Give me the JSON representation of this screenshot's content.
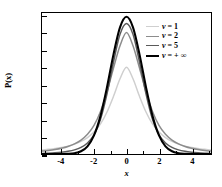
{
  "chart_data": {
    "type": "line",
    "title": "",
    "xlabel": "x",
    "ylabel": "P(x)",
    "xlim": [
      -5.2,
      5.2
    ],
    "ylim": [
      0.0,
      0.41
    ],
    "grid": false,
    "legend_position": "top-right",
    "xticks": [
      "-4",
      "-2",
      "0",
      "2",
      "4"
    ],
    "xtick_values": [
      -4,
      -2,
      0,
      2,
      4
    ],
    "xminor_values": [
      -5,
      -3,
      -1,
      1,
      3,
      5
    ],
    "yticks": [
      "0.00",
      "0.05",
      "0.10",
      "0.15",
      "0.20",
      "0.25",
      "0.30",
      "0.35",
      "0.40"
    ],
    "ytick_values": [
      0.0,
      0.05,
      0.1,
      0.15,
      0.2,
      0.25,
      0.3,
      0.35,
      0.4
    ],
    "series": [
      {
        "name": "v = 1",
        "nu": 1,
        "color": "#cfcfcf",
        "width": 1.5,
        "peak": 0.3183,
        "x": [
          -5.2,
          -4.8,
          -4.4,
          -4,
          -3.6,
          -3.2,
          -2.8,
          -2.4,
          -2,
          -1.6,
          -1.2,
          -0.8,
          -0.4,
          0,
          0.4,
          0.8,
          1.2,
          1.6,
          2,
          2.4,
          2.8,
          3.2,
          3.6,
          4,
          4.4,
          4.8,
          5.2
        ],
        "y": [
          0.0115,
          0.0135,
          0.016,
          0.0187,
          0.023,
          0.0288,
          0.0366,
          0.0478,
          0.0637,
          0.0874,
          0.1222,
          0.1677,
          0.2188,
          0.2523,
          0.2188,
          0.1677,
          0.1222,
          0.0874,
          0.0637,
          0.0478,
          0.0366,
          0.0288,
          0.023,
          0.0187,
          0.016,
          0.0135,
          0.0115
        ]
      },
      {
        "name": "v = 2",
        "nu": 2,
        "color": "#8c8c8c",
        "width": 1.5,
        "peak": 0.3536,
        "x": [
          -5.2,
          -4.8,
          -4.4,
          -4,
          -3.6,
          -3.2,
          -2.8,
          -2.4,
          -2,
          -1.6,
          -1.2,
          -0.8,
          -0.4,
          0,
          0.4,
          0.8,
          1.2,
          1.6,
          2,
          2.4,
          2.8,
          3.2,
          3.6,
          4,
          4.4,
          4.8,
          5.2
        ],
        "y": [
          0.0084,
          0.0103,
          0.0129,
          0.0166,
          0.0218,
          0.0293,
          0.0404,
          0.0573,
          0.0833,
          0.1238,
          0.1808,
          0.25,
          0.3147,
          0.3536,
          0.3147,
          0.25,
          0.1808,
          0.1238,
          0.0833,
          0.0573,
          0.0404,
          0.0293,
          0.0218,
          0.0166,
          0.0129,
          0.0103,
          0.0084
        ]
      },
      {
        "name": "v = 5",
        "nu": 5,
        "color": "#5a5a5a",
        "width": 1.5,
        "peak": 0.3796,
        "x": [
          -5.2,
          -4.8,
          -4.4,
          -4,
          -3.6,
          -3.2,
          -2.8,
          -2.4,
          -2,
          -1.6,
          -1.2,
          -0.8,
          -0.4,
          0,
          0.4,
          0.8,
          1.2,
          1.6,
          2,
          2.4,
          2.8,
          3.2,
          3.6,
          4,
          4.4,
          4.8,
          5.2
        ],
        "y": [
          0.0018,
          0.0025,
          0.0035,
          0.0051,
          0.0077,
          0.012,
          0.0193,
          0.0322,
          0.056,
          0.1007,
          0.1749,
          0.2676,
          0.3478,
          0.3796,
          0.3478,
          0.2676,
          0.1749,
          0.1007,
          0.056,
          0.0322,
          0.0193,
          0.012,
          0.0077,
          0.0051,
          0.0035,
          0.0025,
          0.0018
        ]
      },
      {
        "name": "v = + ∞",
        "nu": "+inf",
        "color": "#000000",
        "width": 2.1,
        "peak": 0.3989,
        "x": [
          -5.2,
          -4.8,
          -4.4,
          -4,
          -3.6,
          -3.2,
          -2.8,
          -2.4,
          -2,
          -1.6,
          -1.2,
          -0.8,
          -0.4,
          0,
          0.4,
          0.8,
          1.2,
          1.6,
          2,
          2.4,
          2.8,
          3.2,
          3.6,
          4,
          4.4,
          4.8,
          5.2
        ],
        "y": [
          0.0,
          0.0,
          0.0,
          0.0001,
          0.0006,
          0.0024,
          0.0079,
          0.0224,
          0.054,
          0.1109,
          0.1942,
          0.2897,
          0.3683,
          0.3989,
          0.3683,
          0.2897,
          0.1942,
          0.1109,
          0.054,
          0.0224,
          0.0079,
          0.0024,
          0.0006,
          0.0001,
          0.0,
          0.0,
          0.0
        ]
      }
    ]
  },
  "legend": {
    "items": [
      {
        "label": "v = 1",
        "color": "#cfcfcf"
      },
      {
        "label": "v = 2",
        "color": "#8c8c8c"
      },
      {
        "label": "v = 5",
        "color": "#5a5a5a"
      },
      {
        "label": "v = + ∞",
        "color": "#000000"
      }
    ]
  },
  "axes": {
    "frame_color": "#000000",
    "background": "#ffffff"
  }
}
